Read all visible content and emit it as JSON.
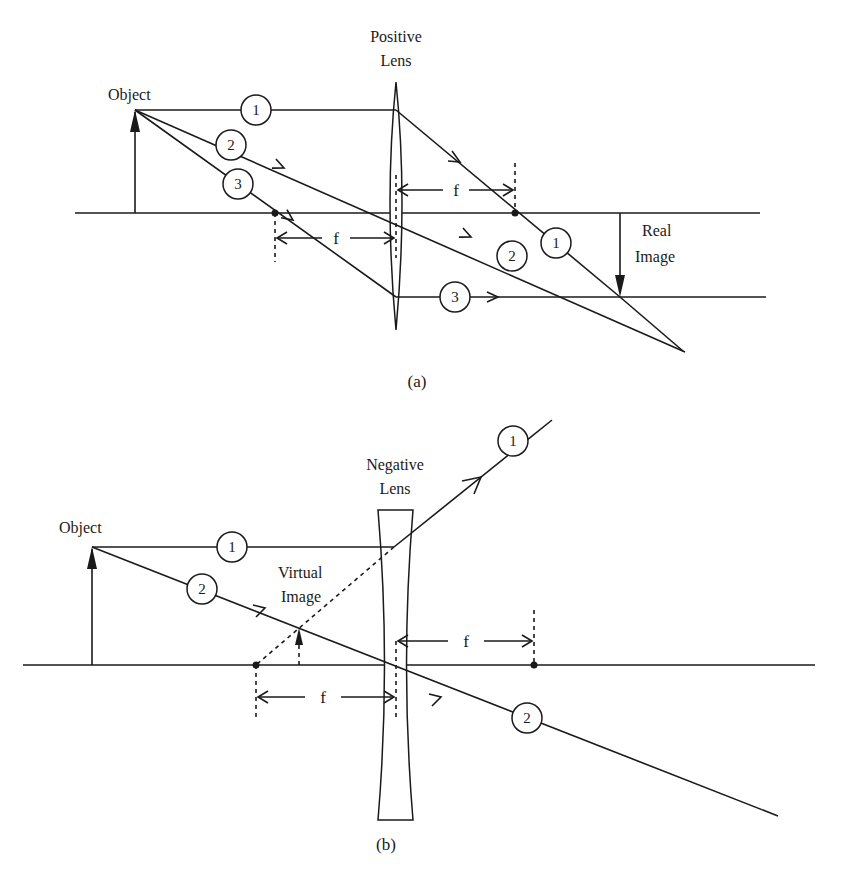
{
  "figure_a": {
    "caption": "(a)",
    "lens_label_line1": "Positive",
    "lens_label_line2": "Lens",
    "object_label": "Object",
    "image_label_line1": "Real",
    "image_label_line2": "Image",
    "focal_label_left": "f",
    "focal_label_right": "f",
    "ray_labels": [
      "1",
      "2",
      "3"
    ],
    "ray_1_after_label": "1",
    "ray_2_after_label": "2",
    "ray_3_after_label": "3"
  },
  "figure_b": {
    "caption": "(b)",
    "lens_label_line1": "Negative",
    "lens_label_line2": "Lens",
    "object_label": "Object",
    "image_label_line1": "Virtual",
    "image_label_line2": "Image",
    "focal_label_left": "f",
    "focal_label_right": "f",
    "ray_labels": [
      "1",
      "2"
    ],
    "ray_1_after_label": "1",
    "ray_2_after_label": "2"
  },
  "colors": {
    "line": "#1a1a1a",
    "background": "#ffffff"
  }
}
